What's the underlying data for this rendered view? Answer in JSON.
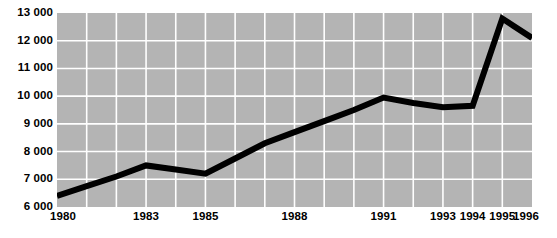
{
  "chart_data": {
    "type": "line",
    "title": "",
    "subtitle": "",
    "xlabel": "",
    "ylabel": "",
    "xlim": [
      1980,
      1996
    ],
    "ylim": [
      6000,
      13000
    ],
    "grid": true,
    "legend": null,
    "legend_position": "none",
    "series_color": "#000000",
    "plot_background": "#b4b4b4",
    "gridline_color": "#ffffff",
    "x": [
      1980,
      1981,
      1982,
      1983,
      1984,
      1985,
      1986,
      1987,
      1988,
      1989,
      1990,
      1991,
      1992,
      1993,
      1994,
      1995,
      1996
    ],
    "series": [
      {
        "name": "",
        "values": [
          6400,
          6750,
          7100,
          7500,
          7350,
          7200,
          7750,
          8300,
          8700,
          9100,
          9500,
          9950,
          9750,
          9600,
          9650,
          12800,
          12100
        ]
      }
    ],
    "y_ticks": [
      6000,
      7000,
      8000,
      9000,
      10000,
      11000,
      12000,
      13000
    ],
    "y_tick_labels": [
      "6 000",
      "7 000",
      "8 000",
      "9 000",
      "10 000",
      "11 000",
      "12 000",
      "13 000"
    ],
    "x_ticks": [
      1980,
      1983,
      1985,
      1988,
      1991,
      1993,
      1994,
      1995,
      1996
    ],
    "x_tick_labels": [
      "1980",
      "1983",
      "1985",
      "1988",
      "1991",
      "1993",
      "1994",
      "1995",
      "1996"
    ]
  }
}
